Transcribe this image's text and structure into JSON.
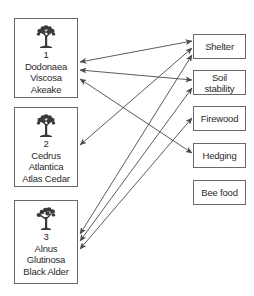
{
  "trees": [
    {
      "number": "1",
      "genus": "Dodonaea",
      "species": "Viscosa",
      "common": "Akeake",
      "icon": "tree-icon"
    },
    {
      "number": "2",
      "genus": "Cedrus",
      "species": "Atlantica",
      "common": "Atlas Cedar",
      "icon": "tree-icon"
    },
    {
      "number": "3",
      "genus": "Alnus",
      "species": "Glutinosa",
      "common": "Black Alder",
      "icon": "tree-icon"
    }
  ],
  "benefits": [
    {
      "line1": "Shelter",
      "line2": ""
    },
    {
      "line1": "Soil",
      "line2": "stability"
    },
    {
      "line1": "Firewood",
      "line2": ""
    },
    {
      "line1": "Hedging",
      "line2": ""
    },
    {
      "line1": "Bee food",
      "line2": ""
    }
  ],
  "connections": [
    {
      "tree": "1",
      "benefit": "Shelter",
      "bidirectional": true
    },
    {
      "tree": "1",
      "benefit": "Soil stability",
      "bidirectional": true
    },
    {
      "tree": "1",
      "benefit": "Hedging",
      "bidirectional": true
    },
    {
      "tree": "2",
      "benefit": "Shelter",
      "bidirectional": true
    },
    {
      "tree": "3",
      "benefit": "Shelter",
      "bidirectional": true
    },
    {
      "tree": "3",
      "benefit": "Soil stability",
      "bidirectional": true
    },
    {
      "tree": "3",
      "benefit": "Firewood",
      "bidirectional": true
    }
  ],
  "colors": {
    "line": "#4a4a4a",
    "border": "#6a6a6a",
    "text": "#2a2a2a",
    "background": "#ffffff"
  }
}
